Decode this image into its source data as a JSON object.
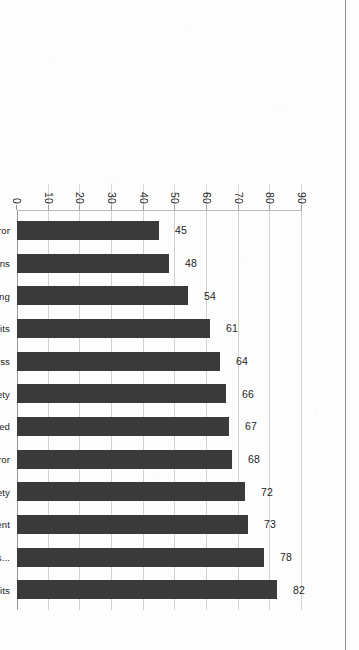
{
  "chart_data": {
    "type": "bar",
    "title": "",
    "xlabel": "",
    "ylabel": "",
    "orientation": "vertical-bars-on-rotated-page",
    "categories": [
      "Nonpunitive response to error",
      "Handoffs and transitions",
      "Staffing",
      "Teamwork across units",
      "Communication openness",
      "Overall perceptions of patient safety",
      "Frequency of events reported",
      "Feedback and communication about error",
      "Management support for patient safety",
      "Organizational learning—continuous improvement",
      "Supervisor/manager expectations and actions...",
      "Teamwork within units"
    ],
    "values": [
      45,
      48,
      54,
      61,
      64,
      66,
      67,
      68,
      72,
      73,
      78,
      82
    ],
    "value_labels": [
      "45",
      "48",
      "54",
      "61",
      "64",
      "66",
      "67",
      "68",
      "72",
      "73",
      "78",
      "82"
    ],
    "ylim": [
      0,
      90
    ],
    "yticks": [
      0,
      10,
      20,
      30,
      40,
      50,
      60,
      70,
      80,
      90
    ],
    "ytick_labels": [
      "0",
      "10",
      "20",
      "30",
      "40",
      "50",
      "60",
      "70",
      "80",
      "90"
    ],
    "grid": true,
    "legend": null,
    "series": [
      {
        "name": "Percent positive response",
        "values": [
          45,
          48,
          54,
          61,
          64,
          66,
          67,
          68,
          72,
          73,
          78,
          82
        ]
      }
    ]
  },
  "style": {
    "bar_color": "#3a3a3a",
    "grid_color": "#d2d2d2",
    "axis_color": "#9a9a9a",
    "text_color": "#1d1d1d",
    "page_background": "#fdfdfd",
    "page_edge_color": "#8d8d8d"
  }
}
